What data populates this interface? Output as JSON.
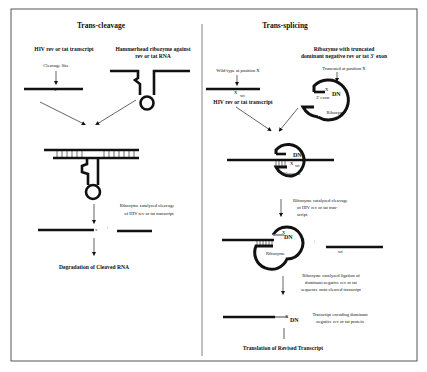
{
  "left_panel": {
    "title": "Trans-cleavage",
    "transcript_label": "HIV rev or tat transcript",
    "cleavage_site_label": "Cleavage Site",
    "ribozyme_label_line1": "Hammerhead ribozyme against",
    "ribozyme_label_line2": "rev or tat RNA",
    "step1_line1": "Ribozyme catalyzed cleavage",
    "step1_line2": "of HIV rev or tat transcript",
    "plus": "+",
    "outcome": "Degradation of Cleaved RNA"
  },
  "right_panel": {
    "title": "Trans-splicing",
    "wildtype_label": "Wild-type at position X",
    "wt_label": "wt",
    "x_mark": "X",
    "transcript_label": "HIV rev or tat transcript",
    "ribozyme_header_line1": "Ribozyme with truncated",
    "ribozyme_header_line2": "dominant negative rev or tat 3' exon",
    "truncated_label": "Truncated at position X",
    "exon_label": "3' exon",
    "dn_label": "DN",
    "ribozyme_label": "Ribozyme",
    "step1_line1": "Ribozyme catalyzed cleavage",
    "step1_line2": "of HIV rev or tat tran-",
    "step1_line3": "script",
    "plus": "+",
    "step2_line1": "Ribozyme catalyzed ligation of",
    "step2_line2": "dominant negative rev or tat",
    "step2_line3": "sequence onto cleaved transcript",
    "product_line1": "Transcript encoding dominant",
    "product_line2": "negative rev or tat protein",
    "outcome": "Translation of Revised Transcript"
  }
}
